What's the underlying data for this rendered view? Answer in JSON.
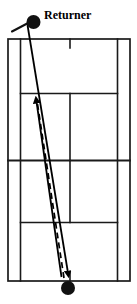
{
  "diagram": {
    "type": "tennis-court-overhead",
    "orientation": "vertical",
    "colors": {
      "court_line": "#1a1a1a",
      "background": "#ffffff",
      "marker": "#111111",
      "trajectory": "#000000"
    },
    "labels": {
      "returner": "Returner"
    },
    "court": {
      "doubles_left_x": 8,
      "doubles_right_x": 130,
      "singles_left_x": 20,
      "singles_right_x": 118,
      "top_baseline_y": 39,
      "bottom_baseline_y": 281,
      "near_service_line_y": 93,
      "net_y": 160,
      "far_service_line_y": 222,
      "center_service_x": 70,
      "top_center_mark": {
        "x": 70,
        "y_from": 39,
        "y_to": 48
      },
      "bottom_center_mark": {
        "x": 70,
        "y_from": 272,
        "y_to": 281
      }
    },
    "markers": [
      {
        "name": "returner-player",
        "label": "Returner",
        "x": 33,
        "y": 22,
        "radius": 7,
        "racket": {
          "x1": 12,
          "y1": 31,
          "x2": 30,
          "y2": 21
        }
      },
      {
        "name": "server-player",
        "label": "",
        "x": 68,
        "y": 288,
        "radius": 7
      }
    ],
    "trajectories": [
      {
        "name": "serve-path",
        "style": "solid",
        "direction": "downward",
        "x1": 28,
        "y1": 26,
        "x2": 69,
        "y2": 278,
        "arrow_at": "end"
      },
      {
        "name": "return-path",
        "style": "solid",
        "direction": "upward",
        "x1": 61,
        "y1": 276,
        "x2": 36,
        "y2": 95,
        "arrow_at": "end"
      },
      {
        "name": "ball-bounce-path",
        "style": "dashed",
        "direction": "upward",
        "x1": 64,
        "y1": 278,
        "x2": 37,
        "y2": 104,
        "arrow_at": "none"
      }
    ]
  }
}
